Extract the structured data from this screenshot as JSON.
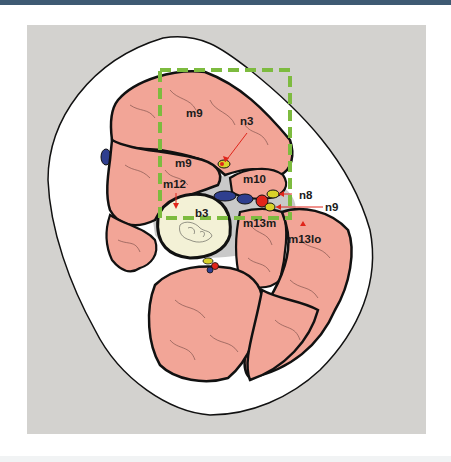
{
  "figure": {
    "type": "anatomical cross-section diagram",
    "colors": {
      "header_bar": "#3e5a73",
      "panel_background": "#d3d2cf",
      "skin": "#ffffff",
      "muscle": "#f2a597",
      "fascia": "#c9c9c9",
      "bone": "#f3f1d6",
      "vein": "#2f3f8f",
      "artery": "#e0251b",
      "nerve": "#d9d22a",
      "highlight_box": "#7dbb3f",
      "leader_line": "#e0251b"
    },
    "labels": {
      "m9_upper": "m9",
      "n3": "n3",
      "m9_lower": "m9",
      "m12": "m12",
      "m10": "m10",
      "n8": "n8",
      "n9": "n9",
      "b3": "b3",
      "m13m": "m13m",
      "m13lo": "m13lo"
    }
  }
}
